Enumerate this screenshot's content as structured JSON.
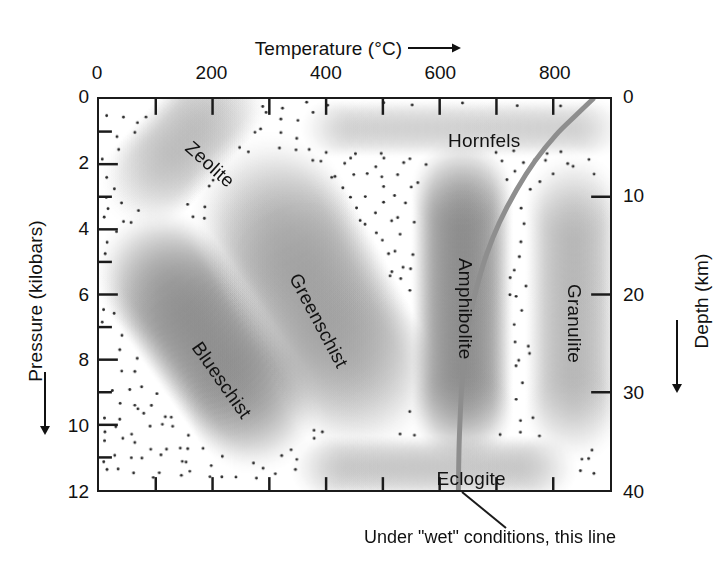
{
  "figure": {
    "caption": "Under \"wet\" conditions, this line"
  },
  "axes": {
    "top": {
      "label": "Temperature (°C)",
      "arrow": "right-arrow-icon",
      "ticks": [
        "0",
        "200",
        "400",
        "600",
        "800"
      ],
      "tick_values": [
        0,
        200,
        400,
        600,
        800
      ],
      "minor_step": 100,
      "range": [
        0,
        900
      ]
    },
    "left": {
      "label": "Pressure (kilobars)",
      "arrow": "down-arrow-icon",
      "ticks": [
        "0",
        "2",
        "4",
        "6",
        "8",
        "10",
        "12"
      ],
      "tick_values": [
        0,
        2,
        4,
        6,
        8,
        10,
        12
      ],
      "minor_step": 1,
      "range": [
        0,
        12
      ]
    },
    "right": {
      "label": "Depth (km)",
      "arrow": "down-arrow-icon",
      "ticks": [
        "0",
        "10",
        "20",
        "30",
        "40"
      ],
      "tick_values": [
        0,
        10,
        20,
        30,
        40
      ],
      "range": [
        0,
        40
      ]
    }
  },
  "chart_data": {
    "type": "scatter",
    "xlabel": "Temperature (°C)",
    "ylabel": "Pressure (kilobars)",
    "y2label": "Depth (km)",
    "xlim": [
      0,
      900
    ],
    "ylim": [
      0,
      12
    ],
    "y2lim": [
      0,
      40
    ],
    "y_inverted": true,
    "grid": false,
    "legend": "none",
    "facies": [
      {
        "name": "Zeolite",
        "label_t": 155,
        "label_p": 1.05,
        "rotation_deg": 42,
        "center_t": 150,
        "center_p": 1.3,
        "extent_t": 250,
        "extent_p": 3.0,
        "shade": "light"
      },
      {
        "name": "Hornfels",
        "label_t": 610,
        "label_p": 0.95,
        "rotation_deg": 0,
        "center_t": 640,
        "center_p": 0.9,
        "extent_t": 500,
        "extent_p": 1.8,
        "shade": "medium"
      },
      {
        "name": "Blueschist",
        "label_t": 170,
        "label_p": 7.1,
        "rotation_deg": 55,
        "center_t": 190,
        "center_p": 7.4,
        "extent_t": 230,
        "extent_p": 6.5,
        "shade": "dark"
      },
      {
        "name": "Greenschist",
        "label_t": 340,
        "label_p": 5.0,
        "rotation_deg": 62,
        "center_t": 380,
        "center_p": 6.0,
        "extent_t": 280,
        "extent_p": 7.5,
        "shade": "medium"
      },
      {
        "name": "Amphibolite",
        "label_t": 640,
        "label_p": 4.5,
        "rotation_deg": 90,
        "center_t": 640,
        "center_p": 6.2,
        "extent_t": 180,
        "extent_p": 8.0,
        "shade": "darkest"
      },
      {
        "name": "Granulite",
        "label_t": 830,
        "label_p": 5.3,
        "rotation_deg": 90,
        "center_t": 835,
        "center_p": 6.4,
        "extent_t": 170,
        "extent_p": 7.6,
        "shade": "medium"
      },
      {
        "name": "Eclogite",
        "label_t": 590,
        "label_p": 11.2,
        "rotation_deg": 0,
        "center_t": 590,
        "center_p": 11.3,
        "extent_t": 430,
        "extent_p": 2.0,
        "shade": "medium"
      }
    ],
    "geotherm": {
      "name": "Wet solidus / geotherm line",
      "color": "#8e8e8e",
      "points_t_p": [
        [
          870,
          0.0
        ],
        [
          840,
          0.5
        ],
        [
          805,
          1.1
        ],
        [
          768,
          1.9
        ],
        [
          735,
          2.8
        ],
        [
          705,
          3.8
        ],
        [
          682,
          4.8
        ],
        [
          665,
          5.8
        ],
        [
          652,
          6.8
        ],
        [
          644,
          7.8
        ],
        [
          639,
          8.8
        ],
        [
          636,
          9.8
        ],
        [
          634,
          10.8
        ],
        [
          633,
          12.0
        ]
      ]
    },
    "annotation": {
      "text": "Under \"wet\" conditions, this line",
      "leader_from_t": 633,
      "leader_from_p": 12.0
    }
  }
}
